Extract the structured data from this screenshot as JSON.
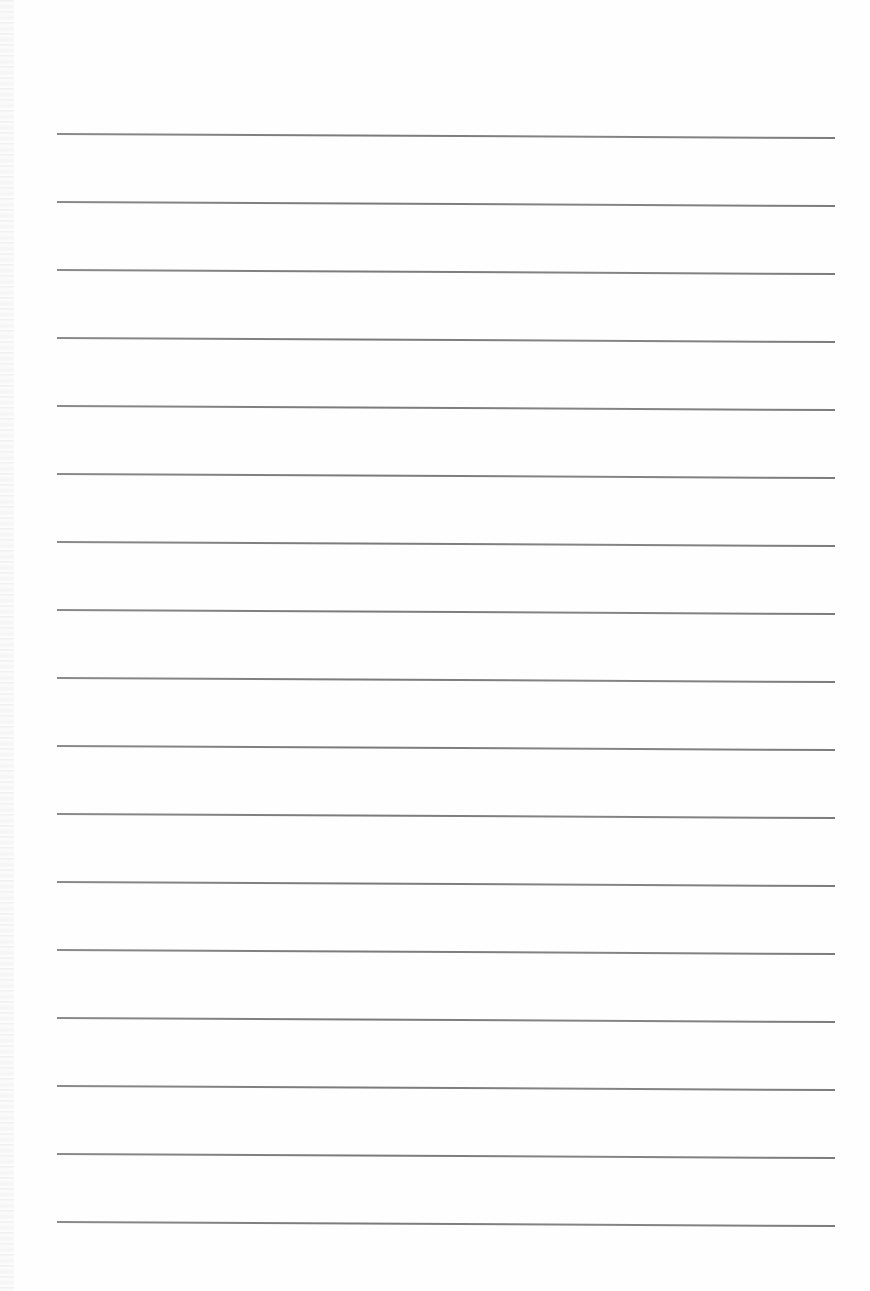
{
  "document": {
    "type": "blank ruled page",
    "line_count": 17,
    "line_color": "#7f7f7f",
    "paper_color": "#fefefe",
    "text_content": []
  }
}
